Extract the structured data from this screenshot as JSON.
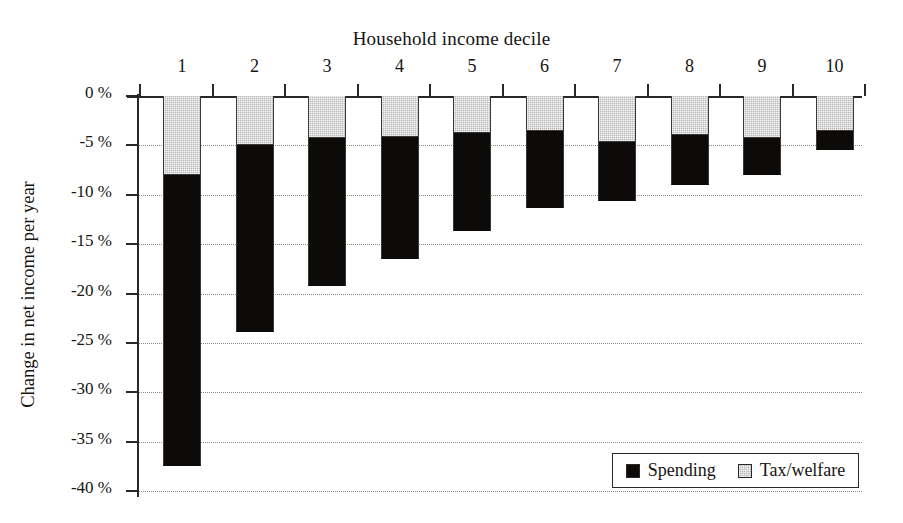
{
  "chart_data": {
    "type": "bar",
    "title": "Household income decile",
    "xlabel": "Household income decile",
    "ylabel": "Change in net income per year",
    "categories": [
      "1",
      "2",
      "3",
      "4",
      "5",
      "6",
      "7",
      "8",
      "9",
      "10"
    ],
    "ylim": [
      -40,
      0
    ],
    "ytick_labels": [
      "0 %",
      "-5 %",
      "-10 %",
      "-15 %",
      "-20 %",
      "-25 %",
      "-30 %",
      "-35 %",
      "-40 %"
    ],
    "ytick_values": [
      0,
      -5,
      -10,
      -15,
      -20,
      -25,
      -30,
      -35,
      -40
    ],
    "grid": "horizontal-dotted",
    "stacked": true,
    "legend_position": "bottom-right",
    "series": [
      {
        "name": "Tax/welfare",
        "color": "#b9b9b9",
        "values": [
          -8.0,
          -5.0,
          -4.3,
          -4.2,
          -3.7,
          -3.5,
          -4.7,
          -3.9,
          -4.3,
          -3.5
        ]
      },
      {
        "name": "Spending",
        "color": "#0d0b0a",
        "values": [
          -29.5,
          -18.9,
          -14.9,
          -12.3,
          -10.0,
          -7.8,
          -5.9,
          -5.1,
          -3.7,
          -2.0
        ]
      }
    ],
    "totals": [
      -37.5,
      -23.9,
      -19.2,
      -16.5,
      -13.7,
      -11.3,
      -10.6,
      -9.0,
      -8.0,
      -5.5
    ]
  },
  "legend": {
    "items": [
      {
        "label": "Spending",
        "swatch": "black-square-icon"
      },
      {
        "label": "Tax/welfare",
        "swatch": "gray-square-icon"
      }
    ]
  }
}
